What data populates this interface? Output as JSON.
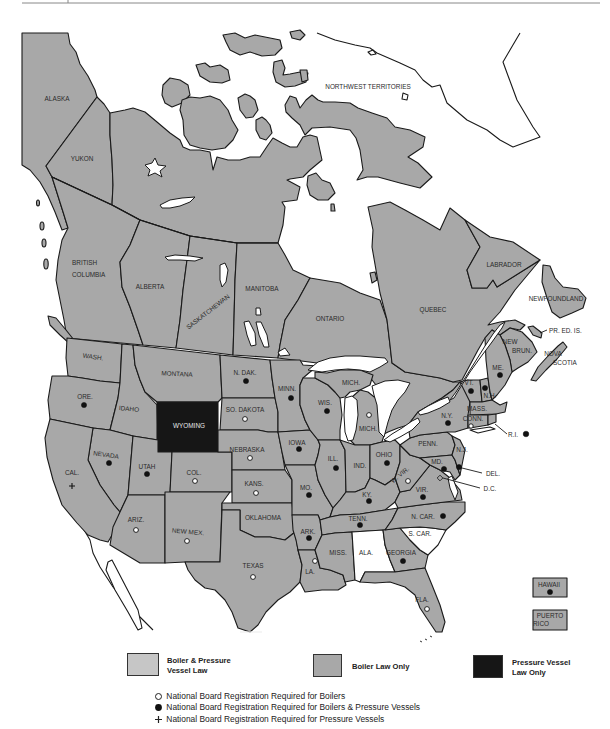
{
  "map": {
    "regions": {
      "alaska": {
        "label": "ALASKA",
        "fill": "gray"
      },
      "yukon": {
        "label": "YUKON",
        "fill": "gray"
      },
      "northwest_territories": {
        "label": "NORTHWEST TERRITORIES",
        "fill": "gray"
      },
      "british_columbia": {
        "label": [
          "BRITISH",
          "COLUMBIA"
        ],
        "fill": "gray"
      },
      "alberta": {
        "label": "ALBERTA",
        "fill": "gray"
      },
      "saskatchewan": {
        "label": "SASKATCHEWAN",
        "fill": "gray"
      },
      "manitoba": {
        "label": "MANITOBA",
        "fill": "gray"
      },
      "ontario": {
        "label": "ONTARIO",
        "fill": "gray"
      },
      "quebec": {
        "label": "QUEBEC",
        "fill": "gray"
      },
      "labrador": {
        "label": "LABRADOR",
        "fill": "gray"
      },
      "newfoundland": {
        "label": "NEWFOUNDLAND",
        "fill": "gray"
      },
      "pr_ed_is": {
        "label": "PR. ED. IS.",
        "fill": "gray"
      },
      "new_brun": {
        "label": [
          "NEW",
          "BRUN."
        ],
        "fill": "gray"
      },
      "nova_scotia": {
        "label": [
          "NOVA",
          "SCOTIA"
        ],
        "fill": "gray"
      },
      "wash": {
        "label": "WASH.",
        "fill": "gray"
      },
      "ore": {
        "label": "ORE.",
        "fill": "gray",
        "marker": "filled"
      },
      "cal": {
        "label": "CAL.",
        "fill": "gray",
        "marker": "plus"
      },
      "idaho": {
        "label": "IDAHO",
        "fill": "gray"
      },
      "nevada": {
        "label": "NEVADA",
        "fill": "gray",
        "marker": "filled"
      },
      "montana": {
        "label": "MONTANA",
        "fill": "gray"
      },
      "wyoming": {
        "label": "WYOMING",
        "fill": "black"
      },
      "utah": {
        "label": "UTAH",
        "fill": "gray",
        "marker": "filled"
      },
      "col": {
        "label": "COL.",
        "fill": "gray",
        "marker": "open"
      },
      "ariz": {
        "label": "ARIZ.",
        "fill": "gray",
        "marker": "open"
      },
      "new_mex": {
        "label": "NEW MEX.",
        "fill": "gray",
        "marker": "open"
      },
      "n_dak": {
        "label": "N. DAK.",
        "fill": "gray",
        "marker": "filled"
      },
      "so_dakota": {
        "label": "SO. DAKOTA",
        "fill": "gray",
        "marker": "open"
      },
      "nebraska": {
        "label": "NEBRASKA",
        "fill": "gray",
        "marker": "open"
      },
      "kans": {
        "label": "KANS.",
        "fill": "gray",
        "marker": "open"
      },
      "oklahoma": {
        "label": "OKLAHOMA",
        "fill": "gray"
      },
      "texas": {
        "label": "TEXAS",
        "fill": "gray",
        "marker": "open"
      },
      "minn": {
        "label": "MINN.",
        "fill": "gray",
        "marker": "filled"
      },
      "iowa": {
        "label": "IOWA",
        "fill": "gray",
        "marker": "filled"
      },
      "mo": {
        "label": "MO.",
        "fill": "gray",
        "marker": "filled"
      },
      "ark": {
        "label": "ARK.",
        "fill": "gray",
        "marker": "filled"
      },
      "la": {
        "label": "LA.",
        "fill": "gray",
        "marker": "open"
      },
      "wis": {
        "label": "WIS.",
        "fill": "gray",
        "marker": "filled"
      },
      "mich_upper": {
        "label": "MICH.",
        "fill": "gray"
      },
      "mich_lower": {
        "label": "MICH.",
        "fill": "gray",
        "marker": "open"
      },
      "ill": {
        "label": "ILL.",
        "fill": "gray",
        "marker": "filled"
      },
      "ind": {
        "label": "IND.",
        "fill": "gray"
      },
      "ohio": {
        "label": "OHIO",
        "fill": "gray",
        "marker": "filled"
      },
      "ky": {
        "label": "KY.",
        "fill": "gray",
        "marker": "filled"
      },
      "tenn": {
        "label": "TENN.",
        "fill": "gray",
        "marker": "filled"
      },
      "miss": {
        "label": "MISS.",
        "fill": "gray"
      },
      "ala": {
        "label": "ALA.",
        "fill": "white"
      },
      "georgia": {
        "label": "GEORGIA",
        "fill": "gray",
        "marker": "filled"
      },
      "fla": {
        "label": "FLA.",
        "fill": "gray",
        "marker": "open"
      },
      "s_car": {
        "label": "S. CAR.",
        "fill": "white"
      },
      "n_car": {
        "label": "N. CAR.",
        "fill": "gray",
        "marker": "filled"
      },
      "vir": {
        "label": "VIR.",
        "fill": "gray",
        "marker": "filled"
      },
      "w_vir": {
        "label": "W. VIR.",
        "fill": "gray",
        "marker": "open"
      },
      "penn": {
        "label": "PENN.",
        "fill": "gray"
      },
      "n_y": {
        "label": "N.Y.",
        "fill": "gray",
        "marker": "filled"
      },
      "md": {
        "label": "MD.",
        "fill": "gray",
        "marker": "filled"
      },
      "del": {
        "label": "DEL.",
        "fill": "gray",
        "marker": "filled"
      },
      "d_c": {
        "label": "D.C.",
        "fill": "gray"
      },
      "n_j": {
        "label": "N.J.",
        "fill": "gray"
      },
      "vt": {
        "label": "VT.",
        "fill": "gray",
        "marker": "filled"
      },
      "n_h": {
        "label": "N.H.",
        "fill": "gray",
        "marker": "filled"
      },
      "me": {
        "label": "ME.",
        "fill": "gray",
        "marker": "filled"
      },
      "mass": {
        "label": "MASS.",
        "fill": "gray"
      },
      "conn": {
        "label": "CONN.",
        "fill": "gray",
        "marker": "open"
      },
      "r_i": {
        "label": "R.I.",
        "fill": "gray",
        "marker": "filled"
      },
      "hawaii": {
        "label": "HAWAII",
        "fill": "gray",
        "marker": "filled"
      },
      "puerto_rico": {
        "label": [
          "PUERTO",
          "RICO"
        ],
        "fill": "gray"
      }
    }
  },
  "legend": {
    "law_types": [
      {
        "label": [
          "Boiler & Pressure",
          "Vessel Law"
        ],
        "color": "#c6c6c6"
      },
      {
        "label": "Boiler Law Only",
        "color": "#a8a8a8"
      },
      {
        "label": [
          "Pressure Vessel",
          "Law Only"
        ],
        "color": "#161616"
      }
    ],
    "registration": [
      {
        "symbol": "open",
        "text": "National Board Registration Required for Boilers"
      },
      {
        "symbol": "filled",
        "text": "National Board Registration Required for Boilers & Pressure Vessels"
      },
      {
        "symbol": "plus",
        "text": "National Board Registration Required for Pressure Vessels"
      }
    ]
  },
  "colors": {
    "land": "#a8a8a8",
    "light_land": "#c6c6c6",
    "pressure_vessel_only": "#161616",
    "water": "#ffffff",
    "border": "#1a1a1a"
  }
}
